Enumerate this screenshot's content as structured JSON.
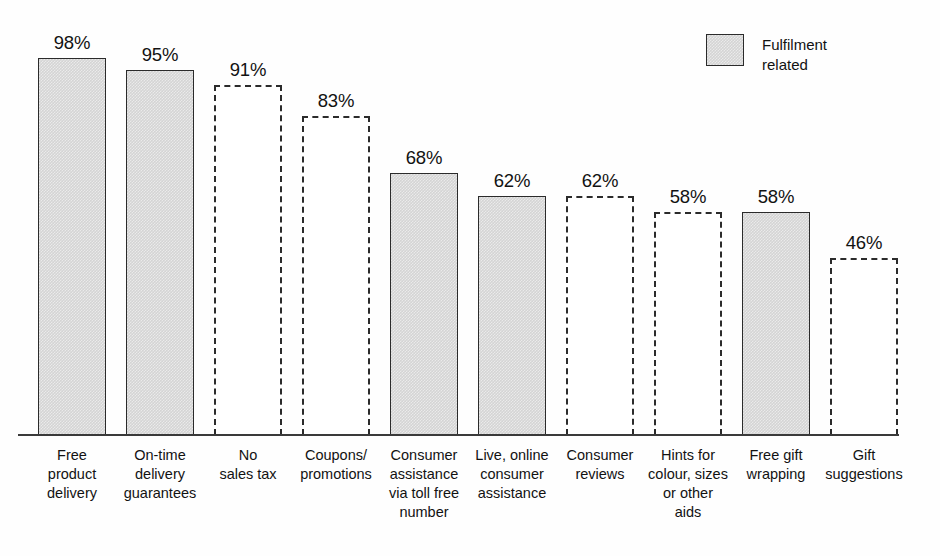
{
  "chart_data": {
    "type": "bar",
    "title": "",
    "subtitle": "",
    "xlabel": "",
    "ylabel": "",
    "ylim": [
      0,
      100
    ],
    "grid": false,
    "value_suffix": "%",
    "categories": [
      "Free\nproduct\ndelivery",
      "On-time\ndelivery\nguarantees",
      "No\nsales tax",
      "Coupons/\npromotions",
      "Consumer\nassistance\nvia toll free\nnumber",
      "Live, online\nconsumer\nassistance",
      "Consumer\nreviews",
      "Hints for\ncolour, sizes\nor other\naids",
      "Free gift\nwrapping",
      "Gift\nsuggestions"
    ],
    "values": [
      98,
      95,
      91,
      83,
      68,
      62,
      62,
      58,
      58,
      46
    ],
    "value_labels": [
      "98%",
      "95%",
      "91%",
      "83%",
      "68%",
      "62%",
      "62%",
      "58%",
      "58%",
      "46%"
    ],
    "styles": [
      "filled",
      "filled",
      "outlined",
      "outlined",
      "filled",
      "filled",
      "outlined",
      "outlined",
      "filled",
      "outlined"
    ],
    "legend": {
      "position": "top-right",
      "entries": [
        {
          "label": "Fulfilment\nrelated",
          "style": "filled",
          "color": "#d4d4d4"
        }
      ]
    },
    "colors": {
      "fill": "#d4d4d4",
      "outline": "#2b2b2b",
      "background": "#fefefe",
      "text": "#121212",
      "axis": "#3a3a3a"
    }
  },
  "legend": {
    "label": "Fulfilment\nrelated"
  }
}
